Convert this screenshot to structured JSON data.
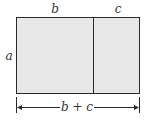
{
  "diagram": {
    "labels": {
      "top_left": "b",
      "top_right": "c",
      "side": "a",
      "bottom_dimension": "b + c"
    },
    "colors": {
      "fill": "#e8e8e8",
      "stroke": "#2a2a2a",
      "text": "#333333"
    }
  }
}
